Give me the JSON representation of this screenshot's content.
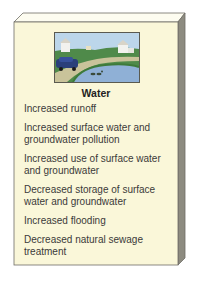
{
  "panel": {
    "title": "Water",
    "illustration": "suburban-pond-with-car-houses-ducks-icon",
    "items": [
      "Increased runoff",
      "Increased surface water and groundwater pollution",
      "Increased use of surface water and groundwater",
      "Decreased storage of surface water and groundwater",
      "Increased flooding",
      "Decreased natural sewage treatment"
    ]
  },
  "colors": {
    "front_face": "#faf7d9",
    "top_face": "#fdfcf0",
    "side_face": "#8d8b80",
    "border": "#6e6d66",
    "sky": "#bcd6ea",
    "water": "#8fb0d6",
    "grass": "#5a9a54",
    "car": "#2a3f7a"
  }
}
